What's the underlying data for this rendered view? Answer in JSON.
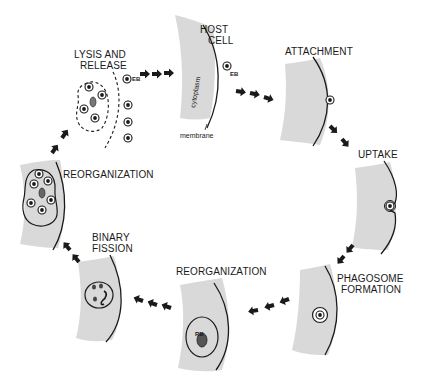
{
  "diagram": {
    "stages": [
      {
        "id": "host-cell",
        "label_line1": "HOST",
        "label_line2": "CELL"
      },
      {
        "id": "attachment",
        "label_line1": "ATTACHMENT"
      },
      {
        "id": "uptake",
        "label_line1": "UPTAKE"
      },
      {
        "id": "phagosome-formation",
        "label_line1": "PHAGOSOME",
        "label_line2": "FORMATION"
      },
      {
        "id": "reorganization-rb",
        "label_line1": "REORGANIZATION"
      },
      {
        "id": "binary-fission",
        "label_line1": "BINARY",
        "label_line2": "FISSION"
      },
      {
        "id": "reorganization-eb",
        "label_line1": "REORGANIZATION"
      },
      {
        "id": "lysis-and-release",
        "label_line1": "LYSIS AND",
        "label_line2": "RELEASE"
      }
    ],
    "annotations": {
      "cytoplasm": "cytoplasm",
      "membrane": "membrane",
      "eb_label_host": "EB",
      "eb_label_lysis": "EB",
      "rb_label": "RB"
    },
    "colors": {
      "cytoplasm": "#d9d9d9",
      "ink": "#1a1a1a",
      "background": "#ffffff"
    }
  }
}
